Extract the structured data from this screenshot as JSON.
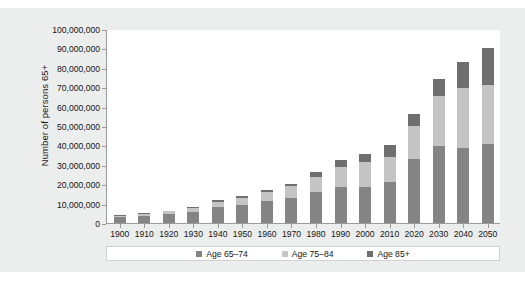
{
  "chart_data": {
    "type": "bar",
    "subtype": "stacked-vertical",
    "title": "",
    "xlabel": "",
    "ylabel": "Number of persons 65+",
    "ylim": [
      0,
      100000000
    ],
    "yticks": [
      0,
      10000000,
      20000000,
      30000000,
      40000000,
      50000000,
      60000000,
      70000000,
      80000000,
      90000000,
      100000000
    ],
    "ytick_labels": [
      "0",
      "10,000,000",
      "20,000,000",
      "30,000,000",
      "40,000,000",
      "50,000,000",
      "60,000,000",
      "70,000,000",
      "80,000,000",
      "90,000,000",
      "100,000,000"
    ],
    "grid": false,
    "legend_position": "bottom",
    "categories": [
      "1900",
      "1910",
      "1920",
      "1930",
      "1940",
      "1950",
      "1960",
      "1970",
      "1980",
      "1990",
      "2000",
      "2010",
      "2020",
      "2030",
      "2040",
      "2050"
    ],
    "series": [
      {
        "name": "Age 65–74",
        "color": "#848484",
        "values": [
          2700000,
          3400000,
          4300000,
          5400000,
          8000000,
          9000000,
          11000000,
          12500000,
          15500000,
          18500000,
          18500000,
          21000000,
          32500000,
          39500000,
          38500000,
          40500000
        ]
      },
      {
        "name": "Age 75–84",
        "color": "#c4c4c4",
        "values": [
          800000,
          1100000,
          1400000,
          1900000,
          2700000,
          3500000,
          4800000,
          6100000,
          7800000,
          10000000,
          12500000,
          13000000,
          17000000,
          25500000,
          31000000,
          30500000
        ]
      },
      {
        "name": "Age 85+",
        "color": "#6f6f6f",
        "values": [
          200000,
          300000,
          400000,
          600000,
          900000,
          1000000,
          1000000,
          1500000,
          2500000,
          3500000,
          4500000,
          6000000,
          6500000,
          9000000,
          13000000,
          19000000
        ]
      }
    ],
    "totals": [
      3700000,
      4800000,
      6100000,
      7900000,
      11600000,
      13500000,
      16800000,
      20100000,
      25800000,
      32000000,
      35500000,
      40000000,
      56000000,
      74000000,
      82500000,
      90000000
    ]
  },
  "legend": {
    "items": [
      {
        "label": "Age 65–74",
        "color": "#848484"
      },
      {
        "label": "Age 75–84",
        "color": "#c4c4c4"
      },
      {
        "label": "Age 85+",
        "color": "#6f6f6f"
      }
    ]
  },
  "caption": ""
}
